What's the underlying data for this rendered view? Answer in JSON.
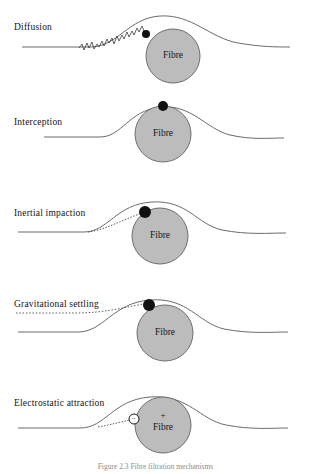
{
  "figure": {
    "caption": "Figure 2.3   Fibre filtration mechanisms",
    "fibre_label": "Fibre",
    "fibre_fill": "#bcbcbc",
    "fibre_stroke": "#6e6e6e",
    "streamline_color": "#6b6b6b",
    "particle_color": "#111111",
    "background": "#ffffff",
    "fibre_diameter_px": 54
  },
  "panels": [
    {
      "id": "diffusion",
      "label": "Diffusion",
      "label_x": 14,
      "label_y": 22,
      "fibre_label": "Fibre",
      "particle": {
        "type": "filled-dot",
        "cx": 146,
        "cy": 34,
        "r": 4
      },
      "trajectory": "random-walk-zigzag",
      "charge": null
    },
    {
      "id": "interception",
      "label": "Interception",
      "label_x": 14,
      "label_y": 117,
      "fibre_label": "Fibre",
      "particle": {
        "type": "filled-dot",
        "cx": 163,
        "cy": 106,
        "r": 5
      },
      "trajectory": "streamline-follow",
      "charge": null
    },
    {
      "id": "inertial-impaction",
      "label": "Inertial impaction",
      "label_x": 14,
      "label_y": 213,
      "fibre_label": "Fibre",
      "particle": {
        "type": "filled-dot",
        "cx": 145,
        "cy": 212,
        "r": 6
      },
      "trajectory": "dotted-straight",
      "charge": null
    },
    {
      "id": "gravitational-settling",
      "label": "Gravitational settling",
      "label_x": 14,
      "label_y": 306,
      "fibre_label": "Fibre",
      "particle": {
        "type": "filled-dot",
        "cx": 149,
        "cy": 305,
        "r": 6
      },
      "trajectory": "dotted-settling-curve",
      "charge": null
    },
    {
      "id": "electrostatic-attraction",
      "label": "Electrostatic attraction",
      "label_x": 14,
      "label_y": 404,
      "fibre_label": "Fibre",
      "particle": {
        "type": "open-circle",
        "cx": 134,
        "cy": 419,
        "r": 5
      },
      "trajectory": "dotted-attraction",
      "charge": {
        "particle": "−",
        "fibre": "+"
      }
    }
  ]
}
